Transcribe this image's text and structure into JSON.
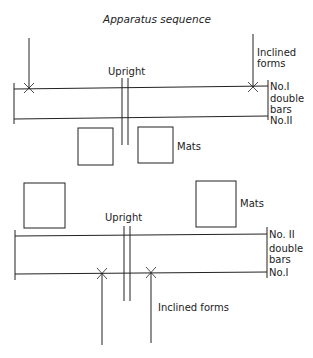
{
  "diagram": {
    "title": "Apparatus sequence",
    "top": {
      "inclined_forms": "Inclined forms",
      "inclined_forms_line1": "Inclined",
      "inclined_forms_line2": "forms",
      "upright": "Upright",
      "bar_top_label": "No.I",
      "double_bars_line1": "double",
      "double_bars_line2": "bars",
      "bar_bottom_label": "No.II",
      "mats": "Mats"
    },
    "bottom": {
      "mats": "Mats",
      "upright": "Upright",
      "bar_top_label": "No. II",
      "double_bars_line1": "double",
      "double_bars_line2": "bars",
      "bar_bottom_label": "No.I",
      "inclined_forms": "Inclined forms"
    }
  }
}
